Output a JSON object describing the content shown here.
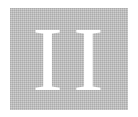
{
  "tile": {
    "text": "II",
    "background_color": "#bdbdbd",
    "text_color": "#ffffff"
  }
}
